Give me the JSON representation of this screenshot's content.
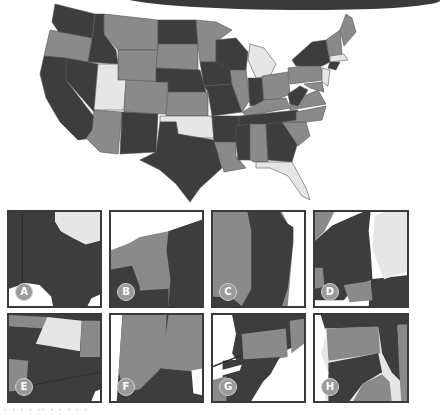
{
  "figure": {
    "title": "",
    "colors": {
      "dark": "#3d3d3d",
      "mid": "#8a8a8a",
      "light": "#e6e6e6",
      "border": "#3a3a3a",
      "badge": "#9a9a9a"
    }
  },
  "main_map": {
    "subject": "United States (contiguous) states, grayscale shading"
  },
  "panels": [
    {
      "label": "A",
      "region": "Texas / Oklahoma border"
    },
    {
      "label": "B",
      "region": "Lake Superior / Minnesota"
    },
    {
      "label": "C",
      "region": "Minnesota / Wisconsin border"
    },
    {
      "label": "D",
      "region": "Wisconsin / Michigan"
    },
    {
      "label": "E",
      "region": "Four Corners (Utah, Colorado, Arizona, New Mexico)"
    },
    {
      "label": "F",
      "region": "Indiana / Ohio"
    },
    {
      "label": "G",
      "region": "Pennsylvania / Ohio / Lake Erie"
    },
    {
      "label": "H",
      "region": "Ohio / Pennsylvania / West Virginia"
    }
  ],
  "caption": "· · ·  · ·· ·  · ·  ·  ·"
}
